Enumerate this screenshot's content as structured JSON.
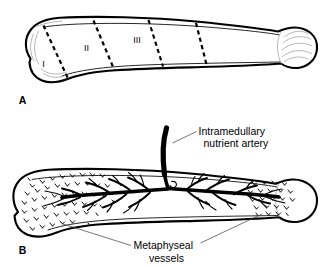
{
  "figure": {
    "type": "anatomical-line-diagram",
    "background_color": "#ffffff",
    "ink_color": "#000000",
    "leader_color": "#4a4a4a"
  },
  "panel_a": {
    "letter": "A",
    "description": "Long bone divided into three zones by dashed transverse lines",
    "zones": [
      {
        "id": "zone-1",
        "label": "I"
      },
      {
        "id": "zone-2",
        "label": "II"
      },
      {
        "id": "zone-3",
        "label": "III"
      }
    ],
    "divider_count": 4,
    "divider_style": "dashed"
  },
  "panel_b": {
    "letter": "B",
    "description": "Same long bone showing intramedullary nutrient artery and metaphyseal vessels",
    "callouts": [
      {
        "id": "nutrient-artery",
        "line_1": "Intramedullary",
        "line_2": "nutrient artery"
      },
      {
        "id": "metaphyseal-vessels",
        "line_1": "Metaphyseal",
        "line_2": "vessels"
      }
    ]
  }
}
